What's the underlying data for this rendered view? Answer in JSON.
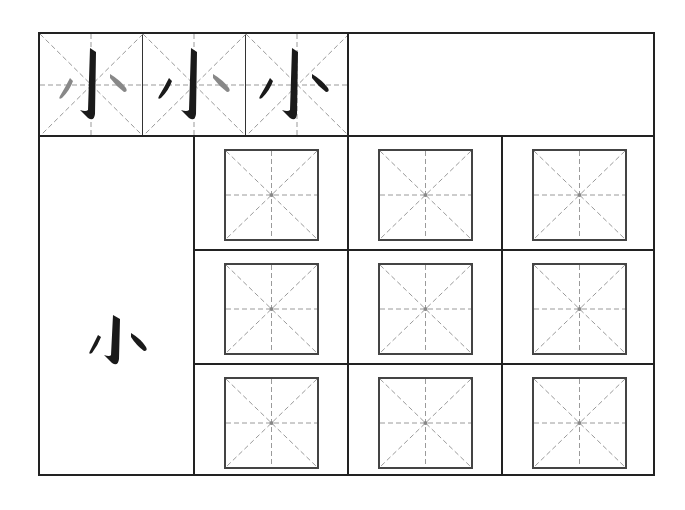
{
  "worksheet": {
    "character": "小",
    "stroke_order": {
      "cells": [
        {
          "step": 1,
          "highlight": "left-dot",
          "label": "小 stroke 1"
        },
        {
          "step": 2,
          "highlight": "right-dot",
          "label": "小 stroke 2"
        },
        {
          "step": 3,
          "highlight": "none",
          "label": "小 complete"
        }
      ],
      "colors": {
        "done": "#1a1a1a",
        "pending": "#8a8a8a"
      }
    },
    "model_character": "小",
    "practice_grid": {
      "rows": 3,
      "columns": 3,
      "cell_type": "mi-zi-ge"
    },
    "colors": {
      "border": "#222222",
      "guide": "#9a9a9a",
      "background": "#ffffff"
    }
  }
}
